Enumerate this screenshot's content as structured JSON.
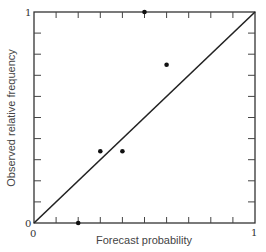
{
  "chart_data": {
    "type": "scatter",
    "title": "",
    "xlabel": "Forecast probability",
    "ylabel": "Observed relative frequency",
    "xlim": [
      0,
      1
    ],
    "ylim": [
      0,
      1
    ],
    "x_tick_labels": [
      "0",
      "1"
    ],
    "y_tick_labels": [
      "0",
      "1"
    ],
    "minor_ticks": 10,
    "grid": false,
    "legend": null,
    "reference_line": {
      "from": [
        0,
        0
      ],
      "to": [
        1,
        1
      ],
      "label": "perfect reliability diagonal"
    },
    "series": [
      {
        "name": "observations",
        "points": [
          {
            "x": 0.2,
            "y": 0.0
          },
          {
            "x": 0.3,
            "y": 0.34
          },
          {
            "x": 0.4,
            "y": 0.34
          },
          {
            "x": 0.5,
            "y": 1.0
          },
          {
            "x": 0.6,
            "y": 0.75
          }
        ]
      }
    ]
  },
  "axes": {
    "x_label": "Forecast probability",
    "y_label": "Observed relative frequency",
    "x_min_label": "0",
    "x_max_label": "1",
    "y_min_label": "0",
    "y_max_label": "1"
  }
}
